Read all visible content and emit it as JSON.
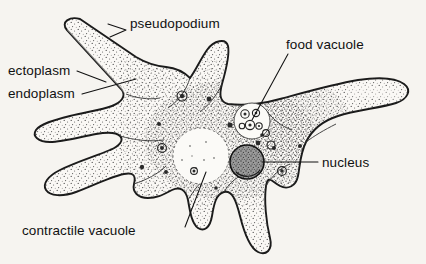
{
  "figure": {
    "type": "labeled-biology-diagram",
    "background_color": "#f6f4f0",
    "ink_color": "#111111"
  },
  "labels": [
    {
      "id": "pseudopodium",
      "text": "pseudopodium",
      "x": 130,
      "y": 28,
      "anchor": "start",
      "leader": "M126,30 L108,24 M126,30 L110,37"
    },
    {
      "id": "food-vacuole",
      "text": "food vacuole",
      "x": 286,
      "y": 49,
      "anchor": "start",
      "leader": "M288,54 L252,120"
    },
    {
      "id": "ectoplasm",
      "text": "ectoplasm",
      "x": 8,
      "y": 75,
      "anchor": "start",
      "leader": "M77,71 L106,82"
    },
    {
      "id": "endoplasm",
      "text": "endoplasm",
      "x": 8,
      "y": 98,
      "anchor": "start",
      "leader": "M82,94 L136,79"
    },
    {
      "id": "nucleus",
      "text": "nucleus",
      "x": 322,
      "y": 167,
      "anchor": "start",
      "leader": "M318,162 L262,162"
    },
    {
      "id": "contractile-vacuole",
      "text": "contractile  vacuole",
      "x": 22,
      "y": 235,
      "anchor": "start",
      "leader": "M185,227 L206,172"
    }
  ],
  "structures": {
    "cell_body": "central mass with radiating pseudopodia",
    "nucleus": {
      "cx": 247,
      "cy": 162,
      "r": 17,
      "shading": "dark-stippled"
    },
    "contractile_vacuole": {
      "cx": 201,
      "cy": 156,
      "r": 28,
      "shading": "clear-pale"
    },
    "food_vacuole": {
      "cx": 252,
      "cy": 121,
      "r": 18,
      "shading": "granular-cluster"
    }
  },
  "pseudopodia_count": 8
}
